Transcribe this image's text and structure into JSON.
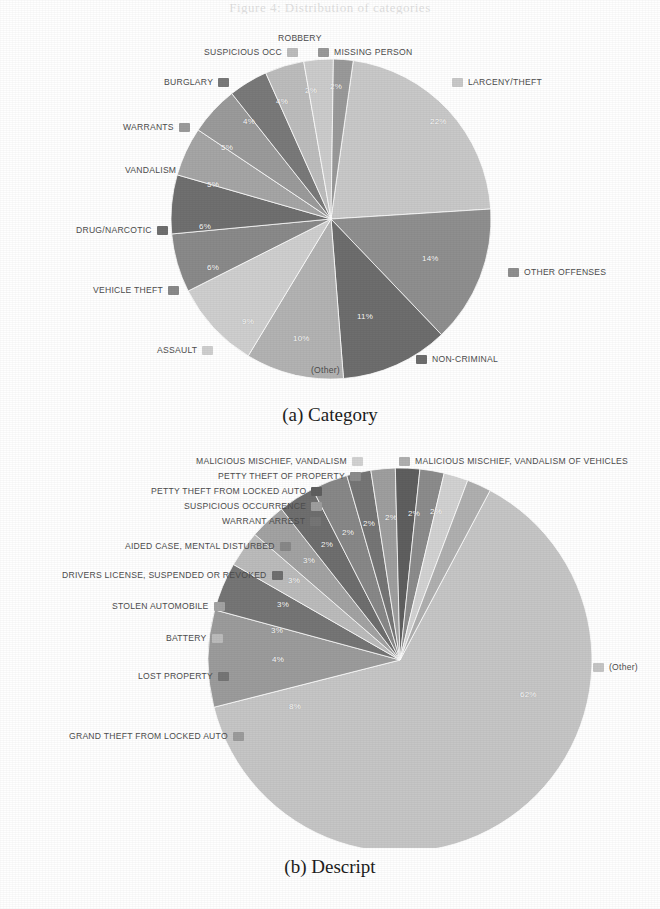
{
  "figure": {
    "top_remnant": "Figure 4: Distribution of categories",
    "caption_a": "(a) Category",
    "caption_b": "(b) Descript"
  },
  "chart_data": [
    {
      "id": "category",
      "type": "pie",
      "title": "(a) Category",
      "legend_position": "around",
      "labels": [
        "LARCENY/THEFT",
        "OTHER OFFENSES",
        "NON-CRIMINAL",
        "(Other)",
        "ASSAULT",
        "VEHICLE THEFT",
        "DRUG/NARCOTIC",
        "VANDALISM",
        "WARRANTS",
        "BURGLARY",
        "SUSPICIOUS OCC",
        "ROBBERY",
        "MISSING PERSON"
      ],
      "values": [
        22,
        14,
        11,
        10,
        9,
        6,
        6,
        5,
        5,
        4,
        4,
        3,
        2
      ],
      "pct_labels": [
        "22%",
        "14%",
        "11%",
        "10%",
        "9%",
        "6%",
        "6%",
        "5%",
        "5%",
        "4%",
        "4%",
        "3%",
        "2%"
      ],
      "colors": [
        "#c9c9c9",
        "#8f8f8f",
        "#6e6e6e",
        "#b3b3b3",
        "#cfcfcf",
        "#8a8a8a",
        "#707070",
        "#a6a6a6",
        "#9b9b9b",
        "#7a7a7a",
        "#bdbdbd",
        "#cccccc",
        "#9a9a9a"
      ]
    },
    {
      "id": "descript",
      "type": "pie",
      "title": "(b) Descript",
      "legend_position": "around",
      "labels": [
        "(Other)",
        "GRAND THEFT FROM LOCKED AUTO",
        "LOST PROPERTY",
        "BATTERY",
        "STOLEN AUTOMOBILE",
        "DRIVERS LICENSE, SUSPENDED OR REVOKED",
        "AIDED CASE, MENTAL DISTURBED",
        "WARRANT ARREST",
        "SUSPICIOUS OCCURRENCE",
        "PETTY THEFT FROM LOCKED AUTO",
        "PETTY THEFT OF PROPERTY",
        "MALICIOUS MISCHIEF, VANDALISM",
        "MALICIOUS MISCHIEF, VANDALISM OF VEHICLES"
      ],
      "values": [
        62,
        8,
        4,
        3,
        3,
        3,
        3,
        2,
        2,
        2,
        2,
        2,
        2
      ],
      "pct_labels": [
        "62%",
        "8%",
        "4%",
        "3%",
        "3%",
        "3%",
        "3%",
        "2%",
        "2%",
        "2%",
        "2%",
        "2%",
        "2%"
      ],
      "colors": [
        "#c6c6c6",
        "#9c9c9c",
        "#767676",
        "#bcbcbc",
        "#a3a3a3",
        "#6f6f6f",
        "#888888",
        "#767676",
        "#9f9f9f",
        "#5f5f5f",
        "#8c8c8c",
        "#d2d2d2",
        "#b0b0b0"
      ]
    }
  ],
  "chart_a": {
    "labels_right": [
      {
        "text": "LARCENY/THEFT",
        "pct": "22%",
        "color": "#c9c9c9"
      },
      {
        "text": "OTHER OFFENSES",
        "pct": "14%",
        "color": "#8f8f8f"
      },
      {
        "text": "NON-CRIMINAL",
        "pct": "11%",
        "color": "#6e6e6e"
      },
      {
        "text": "MISSING PERSON",
        "pct": "2%",
        "color": "#9a9a9a"
      }
    ],
    "labels_left": [
      {
        "text": "(Other)",
        "pct": "10%",
        "color": "#b3b3b3"
      },
      {
        "text": "ASSAULT",
        "pct": "9%",
        "color": "#cfcfcf"
      },
      {
        "text": "VEHICLE THEFT",
        "pct": "6%",
        "color": "#8a8a8a"
      },
      {
        "text": "DRUG/NARCOTIC",
        "pct": "6%",
        "color": "#707070"
      },
      {
        "text": "VANDALISM",
        "pct": "5%",
        "color": "#a6a6a6"
      },
      {
        "text": "WARRANTS",
        "pct": "5%",
        "color": "#9b9b9b"
      },
      {
        "text": "BURGLARY",
        "pct": "4%",
        "color": "#7a7a7a"
      },
      {
        "text": "SUSPICIOUS OCC",
        "pct": "4%",
        "color": "#bdbdbd"
      },
      {
        "text": "ROBBERY",
        "pct": "3%",
        "color": "#cccccc"
      }
    ]
  },
  "chart_b": {
    "labels_right": [
      {
        "text": "MALICIOUS MISCHIEF, VANDALISM OF VEHICLES",
        "pct": "2%",
        "color": "#b0b0b0"
      },
      {
        "text": "(Other)",
        "pct": "62%",
        "color": "#c6c6c6"
      }
    ],
    "labels_left": [
      {
        "text": "MALICIOUS MISCHIEF, VANDALISM",
        "pct": "2%",
        "color": "#d2d2d2"
      },
      {
        "text": "PETTY THEFT OF PROPERTY",
        "pct": "2%",
        "color": "#8c8c8c"
      },
      {
        "text": "PETTY THEFT FROM LOCKED AUTO",
        "pct": "2%",
        "color": "#5f5f5f"
      },
      {
        "text": "SUSPICIOUS OCCURRENCE",
        "pct": "2%",
        "color": "#9f9f9f"
      },
      {
        "text": "WARRANT ARREST",
        "pct": "2%",
        "color": "#767676"
      },
      {
        "text": "AIDED CASE, MENTAL DISTURBED",
        "pct": "3%",
        "color": "#888888"
      },
      {
        "text": "DRIVERS LICENSE, SUSPENDED OR REVOKED",
        "pct": "3%",
        "color": "#6f6f6f"
      },
      {
        "text": "STOLEN AUTOMOBILE",
        "pct": "3%",
        "color": "#a3a3a3"
      },
      {
        "text": "BATTERY",
        "pct": "3%",
        "color": "#bcbcbc"
      },
      {
        "text": "LOST PROPERTY",
        "pct": "4%",
        "color": "#767676"
      },
      {
        "text": "GRAND THEFT FROM LOCKED AUTO",
        "pct": "8%",
        "color": "#9c9c9c"
      }
    ]
  }
}
